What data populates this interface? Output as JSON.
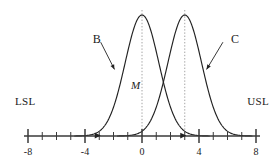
{
  "chart_data": {
    "type": "line",
    "title": "",
    "xlabel": "",
    "ylabel": "",
    "xlim": [
      -8,
      8
    ],
    "ylim": [
      0,
      1.05
    ],
    "grid": false,
    "legend_position": "inline-annotations",
    "axis": {
      "major_ticks": [
        -8,
        -4,
        0,
        4,
        8
      ],
      "major_tick_labels": [
        "-8",
        "-4",
        "0",
        "4",
        "8"
      ],
      "minor_tick_step": 1,
      "minor_ticks": [
        -7,
        -6,
        -5,
        -3,
        -2,
        -1,
        1,
        2,
        3,
        5,
        6,
        7
      ]
    },
    "series": [
      {
        "name": "B",
        "type": "normal-curve",
        "mean": 0,
        "sigma": 1.18,
        "peak_height": 1.0,
        "label": "B",
        "color": "#222222"
      },
      {
        "name": "C",
        "type": "normal-curve",
        "mean": 3,
        "sigma": 1.18,
        "peak_height": 1.0,
        "label": "C",
        "color": "#222222"
      }
    ],
    "reference_lines": [
      {
        "name": "center-line-B",
        "x": 0,
        "style": "dotted",
        "color": "#9a9a9a"
      },
      {
        "name": "center-line-C",
        "x": 3,
        "style": "dotted",
        "color": "#9a9a9a"
      }
    ],
    "annotations": [
      {
        "name": "lsl",
        "text": "LSL",
        "x": -8,
        "y": 0.28
      },
      {
        "name": "usl",
        "text": "USL",
        "x": 8,
        "y": 0.28
      },
      {
        "name": "midpoint",
        "text": "M",
        "x": 0,
        "y": 0.42,
        "italic": true
      },
      {
        "name": "label-b",
        "text": "B",
        "x": -3.6,
        "y": 0.8,
        "arrow_to": [
          -2.0,
          0.55
        ]
      },
      {
        "name": "label-c",
        "text": "C",
        "x": 6.1,
        "y": 0.8,
        "arrow_to": [
          4.6,
          0.55
        ]
      }
    ],
    "axis_markers": [
      {
        "name": "arrowhead-b-left-tail",
        "x": -3.0
      },
      {
        "name": "arrowhead-c-left-tail",
        "x": 3.0
      }
    ]
  },
  "figure": {
    "background": "#ffffff",
    "curve_color": "#222222",
    "axis_color": "#3a3a3a",
    "dash_color": "#9a9a9a",
    "labels": {
      "lsl": "LSL",
      "usl": "USL",
      "midpoint": "M",
      "curve_b": "B",
      "curve_c": "C"
    },
    "tick_labels": [
      "-8",
      "-4",
      "0",
      "4",
      "8"
    ]
  }
}
